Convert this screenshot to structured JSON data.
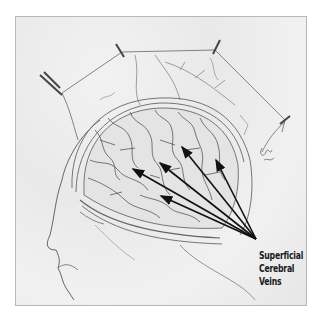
{
  "illustration": {
    "subject": "Pencil illustration of head in profile with scalp retracted, showing brain surface",
    "label": {
      "lines": [
        "Superficial",
        "Cerebral",
        "Veins"
      ]
    },
    "signature": "artist-signature",
    "arrow_count": 5,
    "colors": {
      "background": "#ececec",
      "pencil": "#555555",
      "arrow": "#111111",
      "frame_border": "#b8b8b8"
    }
  }
}
